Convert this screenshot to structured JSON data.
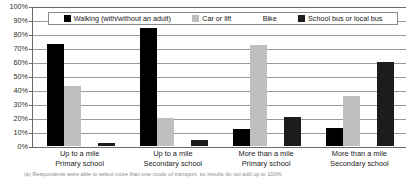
{
  "chart_data": {
    "type": "bar",
    "title": "",
    "subtitle": "",
    "xlabel": "",
    "ylabel": "",
    "ylim": [
      0,
      100
    ],
    "y_tick_labels": [
      "100%",
      "90%",
      "80%",
      "70%",
      "60%",
      "50%",
      "40%",
      "30%",
      "20%",
      "10%",
      "0%"
    ],
    "y_tick_values": [
      100,
      90,
      80,
      70,
      60,
      50,
      40,
      30,
      20,
      10,
      0
    ],
    "grid": true,
    "legend_position": "top-inside",
    "categories": [
      {
        "line1": "Up to a mile",
        "line2": "Primary school"
      },
      {
        "line1": "Up to a mile",
        "line2": "Secondary school"
      },
      {
        "line1": "More than a mile",
        "line2": "Primary school"
      },
      {
        "line1": "More than a mile",
        "line2": "Secondary school"
      }
    ],
    "series": [
      {
        "name": "Walking (with/without an adult)",
        "key": "walking",
        "color": "#000000",
        "values": [
          73,
          84,
          12,
          13
        ]
      },
      {
        "name": "Car or lift",
        "key": "car",
        "color": "#bfbfbf",
        "values": [
          43,
          20,
          72,
          36
        ]
      },
      {
        "name": "Bike",
        "key": "bike",
        "color": "#ffffff",
        "values": [
          1,
          1,
          1,
          1
        ]
      },
      {
        "name": "School bus or local bus",
        "key": "bus",
        "color": "#1c1c1c",
        "values": [
          2,
          4,
          21,
          60
        ]
      }
    ],
    "annotations": {
      "footnote": "(a) Respondents were able to select more than one mode of transport, so results do not add up to 100%"
    }
  }
}
